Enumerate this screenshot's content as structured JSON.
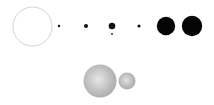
{
  "diagram": {
    "background": "#ffffff",
    "rows": [
      {
        "name": "top-row",
        "bodies": [
          {
            "id": "outline-circle",
            "cx": 32.5,
            "cy": 26.5,
            "r": 19.5,
            "fill": "#ffffff",
            "stroke": "#c8c8c8",
            "style": "outline"
          },
          {
            "id": "dot-1",
            "cx": 59,
            "cy": 26,
            "r": 1.2,
            "fill": "#111111",
            "style": "solid"
          },
          {
            "id": "dot-2",
            "cx": 86,
            "cy": 26,
            "r": 2,
            "fill": "#111111",
            "style": "solid"
          },
          {
            "id": "dot-3",
            "cx": 112,
            "cy": 26,
            "r": 3.3,
            "fill": "#111111",
            "style": "solid"
          },
          {
            "id": "dot-3-satellite",
            "cx": 112,
            "cy": 34,
            "r": 0.9,
            "fill": "#222222",
            "style": "solid"
          },
          {
            "id": "dot-4",
            "cx": 139,
            "cy": 26,
            "r": 1.6,
            "fill": "#111111",
            "style": "solid"
          },
          {
            "id": "disc-large-1",
            "cx": 166,
            "cy": 26,
            "r": 9.2,
            "fill": "#050505",
            "style": "solid"
          },
          {
            "id": "disc-large-2",
            "cx": 192,
            "cy": 26,
            "r": 10.2,
            "fill": "#050505",
            "style": "solid"
          }
        ]
      },
      {
        "name": "bottom-row",
        "bodies": [
          {
            "id": "gray-sphere-large",
            "cx": 100,
            "cy": 81,
            "r": 16.5,
            "fill_light": "#e6e6e6",
            "fill_dark": "#a8a8a8",
            "style": "shaded"
          },
          {
            "id": "gray-sphere-small",
            "cx": 127,
            "cy": 81,
            "r": 8.5,
            "fill_light": "#e2e2e2",
            "fill_dark": "#a5a5a5",
            "style": "shaded"
          }
        ]
      }
    ]
  }
}
